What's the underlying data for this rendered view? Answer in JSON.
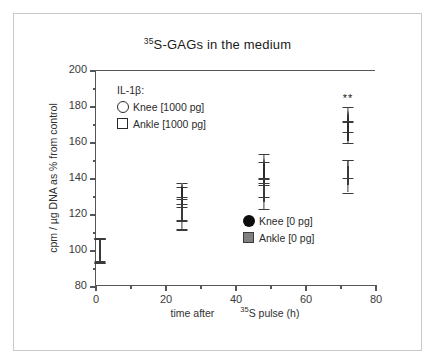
{
  "chart_data": {
    "type": "scatter",
    "title": "35S-GAGs in the medium",
    "title_sup": "35",
    "title_rest": "S-GAGs in the medium",
    "xlabel_part1": "time after",
    "xlabel_sup": "35",
    "xlabel_part2": "S pulse (h)",
    "ylabel": "cpm / µg DNA as % from control",
    "xlim": [
      0,
      80
    ],
    "ylim": [
      80,
      200
    ],
    "xticks": [
      0,
      20,
      40,
      60,
      80
    ],
    "xticklabels": [
      "0",
      "20",
      "40",
      "60",
      "80"
    ],
    "xminorticks": [
      10,
      30,
      50,
      70
    ],
    "yticks": [
      80,
      100,
      120,
      140,
      160,
      180,
      200
    ],
    "yticklabels": [
      "80",
      "100",
      "120",
      "140",
      "160",
      "180",
      "200"
    ],
    "yminorticks": [
      90,
      110,
      130,
      150,
      170,
      190
    ],
    "grid": false,
    "legend_position": "inside-upper-left and inside-middle-right",
    "annotations": [
      {
        "text": "**",
        "x": 72,
        "y": 188,
        "meaning": "significance-marker"
      }
    ],
    "series": [
      {
        "name": "Knee [1000 pg]",
        "marker": "open-circle",
        "color": "#ffffff",
        "edge_color": "#2a2a2a",
        "x": [
          1,
          24.5,
          48,
          72
        ],
        "y": [
          101,
          132,
          146,
          173
        ],
        "yerr": [
          6.5,
          6,
          8,
          7
        ]
      },
      {
        "name": "Ankle [1000 pg]",
        "marker": "open-square",
        "color": "#ffffff",
        "edge_color": "#2a2a2a",
        "x": [
          1,
          24.5,
          48,
          72
        ],
        "y": [
          100,
          130,
          143,
          166
        ],
        "yerr": [
          6.5,
          5.5,
          6.5,
          6
        ]
      },
      {
        "name": "Knee [0 pg]",
        "marker": "filled-circle",
        "color": "#0d0d0d",
        "edge_color": "#0d0d0d",
        "x": [
          1,
          24.5,
          48,
          72
        ],
        "y": [
          100.5,
          123,
          135,
          145.5
        ],
        "yerr": [
          6.5,
          6,
          5,
          5
        ]
      },
      {
        "name": "Ankle [0 pg]",
        "marker": "filled-gray-square",
        "color": "#808080",
        "edge_color": "#3a3a3a",
        "x": [
          1,
          24.5,
          48,
          72
        ],
        "y": [
          100,
          121,
          132,
          141.5
        ],
        "yerr": [
          6.5,
          9,
          8.5,
          9
        ]
      }
    ]
  },
  "legend_il": {
    "header": "IL-1β:",
    "items": [
      {
        "label": "Knee [1000 pg]",
        "marker": "open-circle"
      },
      {
        "label": "Ankle [1000 pg]",
        "marker": "open-square"
      }
    ]
  },
  "legend_control": {
    "items": [
      {
        "label": "Knee [0 pg]",
        "marker": "filled-circle"
      },
      {
        "label": "Ankle [0 pg]",
        "marker": "filled-gray-square"
      }
    ]
  },
  "colors": {
    "axis": "#55565a",
    "text": "#2b2b2b",
    "marker_fill_black": "#0d0d0d",
    "marker_fill_gray": "#808080",
    "frame_border": "#c9c9c9"
  }
}
